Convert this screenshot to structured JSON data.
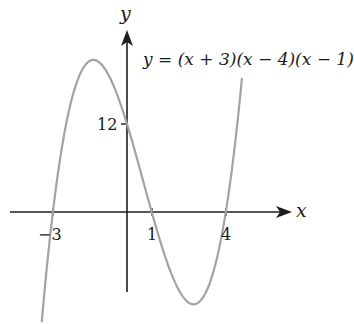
{
  "chart_data": {
    "type": "line",
    "title": "",
    "equation": "y = (x + 3)(x − 4)(x − 1)",
    "xlabel": "x",
    "ylabel": "y",
    "x_ticks": [
      {
        "value": -3,
        "label": "−3"
      },
      {
        "value": 1,
        "label": "1"
      },
      {
        "value": 4,
        "label": "4"
      }
    ],
    "y_ticks": [
      {
        "value": 12,
        "label": "12"
      }
    ],
    "xlim": [
      -5,
      6.7
    ],
    "ylim": [
      -15.3,
      28.9
    ],
    "grid": false,
    "legend": null,
    "series": [
      {
        "name": "y = (x + 3)(x − 4)(x − 1)",
        "roots": [
          -3,
          1,
          4
        ],
        "y_intercept": 12,
        "local_max": {
          "x": -1.36,
          "y": 20.75
        },
        "local_min": {
          "x": 2.69,
          "y": -12.6
        },
        "x_range": [
          -3.45,
          4.65
        ],
        "color": "#a3a3a3"
      }
    ]
  },
  "labels": {
    "x_axis": "x",
    "y_axis": "y",
    "equation": "y = (x + 3)(x − 4)(x − 1)",
    "tick_neg3": "−3",
    "tick_1": "1",
    "tick_4": "4",
    "tick_12": "12"
  },
  "colors": {
    "axis": "#1e1e1e",
    "curve": "#a3a3a3",
    "text": "#1a1a1a",
    "background": "#ffffff"
  }
}
